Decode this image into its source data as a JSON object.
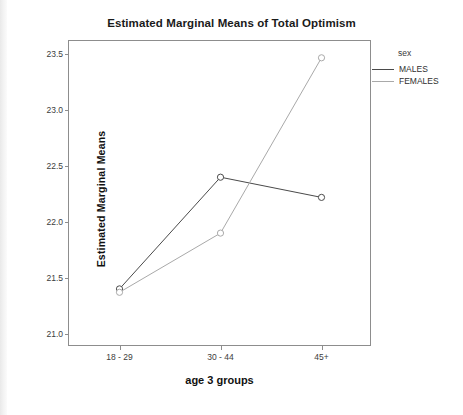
{
  "chart_data": {
    "type": "line",
    "title": "Estimated Marginal Means of Total Optimism",
    "xlabel": "age 3 groups",
    "ylabel": "Estimated Marginal Means",
    "categories": [
      "18 - 29",
      "30 - 44",
      "45+"
    ],
    "yticks": [
      "21.0",
      "21.5",
      "22.0",
      "22.5",
      "23.0",
      "23.5"
    ],
    "ytick_values": [
      21.0,
      21.5,
      22.0,
      22.5,
      23.0,
      23.5
    ],
    "ylim": [
      20.88,
      23.62
    ],
    "grid": false,
    "legend_position": "right",
    "legend_title": "sex",
    "marker": "open-circle",
    "series": [
      {
        "name": "MALES",
        "color": "#4a4a4a",
        "values": [
          21.4,
          22.4,
          22.22
        ]
      },
      {
        "name": "FEMALES",
        "color": "#a9a9a9",
        "values": [
          21.37,
          21.9,
          23.47
        ]
      }
    ]
  }
}
